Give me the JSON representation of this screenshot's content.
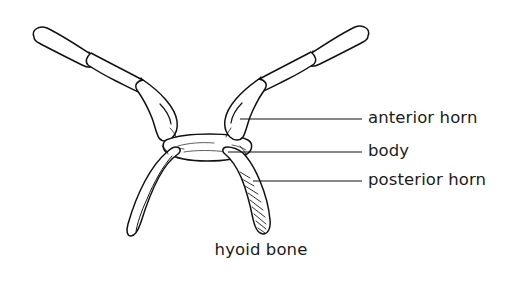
{
  "figure": {
    "caption": "hyoid bone",
    "style": "black-ink-line-drawing",
    "background_color": "#ffffff",
    "ink_color": "#111111",
    "labels": [
      {
        "id": "anterior-horn",
        "text": "anterior horn",
        "leader_line": {
          "x1": 240,
          "y1": 119,
          "x2": 362,
          "y2": 119
        }
      },
      {
        "id": "body",
        "text": "body",
        "leader_line": {
          "x1": 228,
          "y1": 152,
          "x2": 362,
          "y2": 152
        }
      },
      {
        "id": "posterior-horn",
        "text": "posterior horn",
        "leader_line": {
          "x1": 253,
          "y1": 181,
          "x2": 362,
          "y2": 181
        }
      }
    ],
    "parts": [
      {
        "id": "left-anterior-horn",
        "description": "long tapered horn sweeping up and to the left with jointed segment near tip"
      },
      {
        "id": "right-anterior-horn",
        "description": "long tapered horn sweeping up and to the right with jointed segment near tip"
      },
      {
        "id": "body",
        "description": "short horizontal central bar with stippled texture"
      },
      {
        "id": "left-posterior-horn",
        "description": "descending horn curving inward, elongated teardrop outline"
      },
      {
        "id": "right-posterior-horn",
        "description": "descending horn curving inward with diagonal hatching shading"
      }
    ]
  }
}
